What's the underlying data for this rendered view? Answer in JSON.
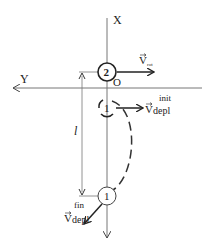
{
  "diagram": {
    "axes": {
      "x_label": "X",
      "y_label": "Y",
      "origin_label": "O"
    },
    "points": {
      "point2_label": "2",
      "point1_init_label": "1",
      "point1_final_label": "1"
    },
    "distance_label": "l",
    "vectors": {
      "v_rot": {
        "symbol": "V",
        "subscript": "rot"
      },
      "v_depl_init": {
        "symbol": "V",
        "subscript": "depl",
        "superscript": "init"
      },
      "v_depl_fin": {
        "symbol": "V",
        "subscript": "depl",
        "superscript": "fin"
      }
    },
    "colors": {
      "line": "#333333",
      "axis": "#777777",
      "background": "#ffffff"
    }
  }
}
